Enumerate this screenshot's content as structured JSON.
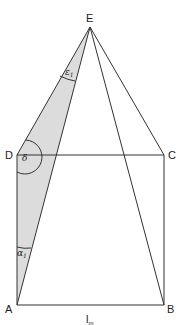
{
  "diagram": {
    "type": "pyramid-construction",
    "points": {
      "A": {
        "label": "A",
        "x": 17,
        "y": 305
      },
      "B": {
        "label": "B",
        "x": 164,
        "y": 305
      },
      "C": {
        "label": "C",
        "x": 164,
        "y": 155
      },
      "D": {
        "label": "D",
        "x": 17,
        "y": 155
      },
      "E": {
        "label": "E",
        "x": 90,
        "y": 27
      }
    },
    "angles": {
      "epsilon": {
        "symbol": "ε",
        "subscript": "1"
      },
      "delta": {
        "symbol": "δ"
      },
      "alpha": {
        "symbol": "α",
        "subscript": "1"
      }
    },
    "bottom_label": {
      "text": "l",
      "subscript": "m"
    },
    "colors": {
      "line": "#333333",
      "shade": "#dcdcdc"
    }
  }
}
